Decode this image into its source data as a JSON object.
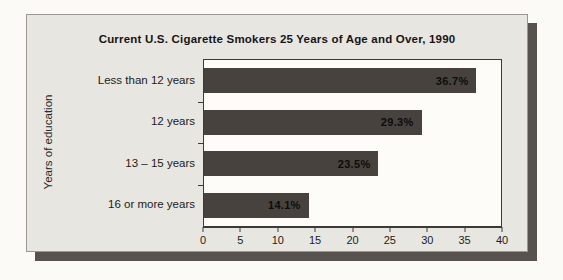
{
  "chart_data": {
    "type": "bar",
    "orientation": "horizontal",
    "title": "Current U.S. Cigarette Smokers 25 Years of Age and Over, 1990",
    "ylabel": "Years of education",
    "categories": [
      "Less than 12 years",
      "12 years",
      "13 – 15  years",
      "16 or more years"
    ],
    "values": [
      36.7,
      29.3,
      23.5,
      14.1
    ],
    "value_labels": [
      "36.7%",
      "29.3%",
      "23.5%",
      "14.1%"
    ],
    "xlim": [
      0,
      40
    ],
    "x_ticks": [
      "0",
      "5",
      "10",
      "15",
      "20",
      "25",
      "30",
      "35",
      "40"
    ],
    "grid": "off",
    "legend": "none",
    "bar_color": "#48423f",
    "plot_background": "#fdfcf8",
    "card_background": "#e8e6e1",
    "shadow_color": "#57524e"
  }
}
